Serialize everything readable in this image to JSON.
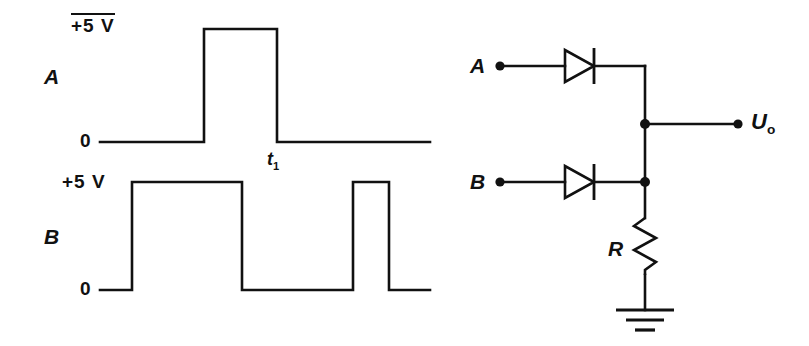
{
  "figure": {
    "kind": "diode-or-gate-with-timing-waveforms",
    "background_color": "#ffffff",
    "line_color": "#111111"
  },
  "waveforms": {
    "signal_a": {
      "name_label": "A",
      "high_label": "+5 V",
      "low_label": "0",
      "marker_label": "t",
      "marker_subscript": "1",
      "high_voltage": 5,
      "low_voltage": 0,
      "levels": [
        0,
        0,
        5,
        5,
        0,
        0
      ],
      "transitions_px": [
        100,
        204,
        204,
        277,
        277,
        430
      ]
    },
    "signal_b": {
      "name_label": "B",
      "high_label": "+5 V",
      "low_label": "0",
      "high_voltage": 5,
      "low_voltage": 0,
      "levels": [
        0,
        0,
        5,
        5,
        0,
        0,
        5,
        5,
        0,
        0
      ],
      "transitions_px": [
        100,
        132,
        132,
        242,
        242,
        353,
        353,
        389,
        389,
        430
      ]
    }
  },
  "circuit": {
    "input_a_label": "A",
    "input_b_label": "B",
    "output_label": "U",
    "output_subscript": "o",
    "resistor_label": "R",
    "diode_a_name": "diode-a",
    "diode_b_name": "diode-b",
    "ground_name": "ground-symbol"
  }
}
